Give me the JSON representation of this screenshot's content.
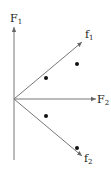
{
  "diagram": {
    "type": "vector-diagram",
    "axes": {
      "vertical": {
        "label": "F",
        "subscript": "1"
      },
      "horizontal": {
        "label": "F",
        "subscript": "2"
      }
    },
    "vectors": [
      {
        "label": "f",
        "subscript": "1",
        "direction": "upper-right"
      },
      {
        "label": "f",
        "subscript": "2",
        "direction": "lower-right"
      }
    ],
    "points": [
      {
        "x": 46,
        "y": 78
      },
      {
        "x": 77,
        "y": 64
      },
      {
        "x": 46,
        "y": 116
      },
      {
        "x": 77,
        "y": 148
      }
    ],
    "colors": {
      "line": "#777777",
      "dot": "#111111",
      "text": "#222222"
    }
  }
}
